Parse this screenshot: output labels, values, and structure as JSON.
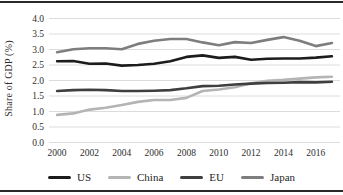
{
  "chart_data": {
    "type": "line",
    "title": "",
    "ylabel": "Share of GDP (%)",
    "xlabel": "",
    "ylim": [
      0.0,
      4.0
    ],
    "ytick_step": 0.5,
    "grid": true,
    "legend_position": "bottom",
    "x": [
      2000,
      2001,
      2002,
      2003,
      2004,
      2005,
      2006,
      2007,
      2008,
      2009,
      2010,
      2011,
      2012,
      2013,
      2014,
      2015,
      2016,
      2017
    ],
    "x_ticks": [
      2000,
      2002,
      2004,
      2006,
      2008,
      2010,
      2012,
      2014,
      2016
    ],
    "y_ticks": [
      "4.0",
      "3.5",
      "3.0",
      "2.5",
      "2.0",
      "1.5",
      "1.0",
      "0.5",
      "0.0"
    ],
    "series": [
      {
        "name": "US",
        "color": "#1c1c1c",
        "values": [
          2.62,
          2.63,
          2.54,
          2.55,
          2.48,
          2.5,
          2.54,
          2.62,
          2.76,
          2.81,
          2.73,
          2.76,
          2.67,
          2.7,
          2.71,
          2.71,
          2.74,
          2.78
        ]
      },
      {
        "name": "China",
        "color": "#b4b4b4",
        "values": [
          0.89,
          0.94,
          1.06,
          1.12,
          1.21,
          1.31,
          1.37,
          1.37,
          1.44,
          1.66,
          1.71,
          1.78,
          1.91,
          1.99,
          2.02,
          2.06,
          2.1,
          2.12
        ]
      },
      {
        "name": "EU",
        "color": "#3f3f3f",
        "values": [
          1.66,
          1.69,
          1.7,
          1.69,
          1.66,
          1.66,
          1.67,
          1.69,
          1.75,
          1.82,
          1.83,
          1.87,
          1.9,
          1.92,
          1.93,
          1.95,
          1.94,
          1.96
        ]
      },
      {
        "name": "Japan",
        "color": "#7e7e7e",
        "values": [
          2.91,
          3.01,
          3.04,
          3.04,
          3.01,
          3.18,
          3.28,
          3.34,
          3.34,
          3.23,
          3.14,
          3.24,
          3.21,
          3.31,
          3.4,
          3.28,
          3.11,
          3.21
        ]
      }
    ],
    "style": {
      "grid_color": "#dcdcdc",
      "tick_label_color": "#2e2e2e",
      "line_width": 2.6
    }
  }
}
